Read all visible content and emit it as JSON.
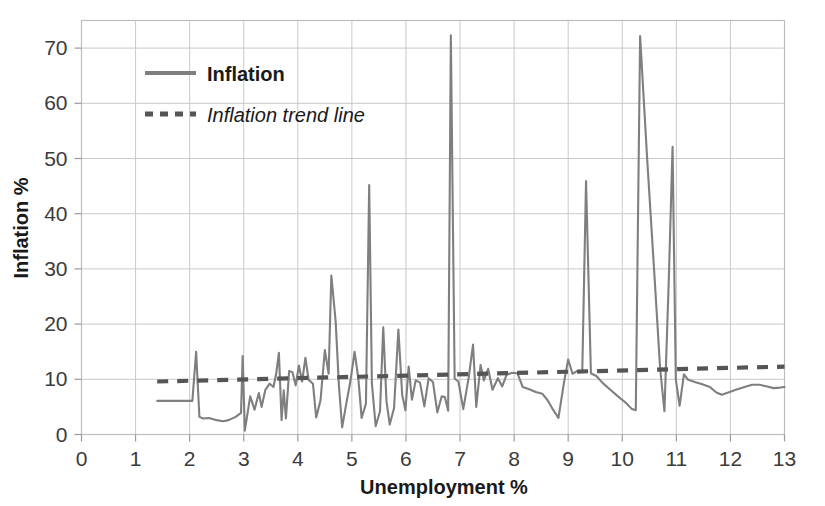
{
  "chart_data": {
    "type": "line",
    "title": "",
    "xlabel": "Unemployment %",
    "ylabel": "Inflation %",
    "xlim": [
      0,
      13
    ],
    "ylim": [
      0,
      75
    ],
    "xticks": [
      "0",
      "1",
      "2",
      "3",
      "4",
      "5",
      "6",
      "7",
      "8",
      "9",
      "10",
      "11",
      "12",
      "13"
    ],
    "yticks": [
      "0",
      "10",
      "20",
      "30",
      "40",
      "50",
      "60",
      "70"
    ],
    "grid": true,
    "legend_position": "upper-left-inside",
    "legend": [
      {
        "label": "Inflation",
        "style": "solid",
        "color": "#7f7f7f",
        "weight": "bold"
      },
      {
        "label": "Inflation trend line",
        "style": "dotted",
        "color": "#555555",
        "weight": "italic"
      }
    ],
    "series": [
      {
        "name": "Inflation",
        "style": "solid",
        "color": "#7f7f7f",
        "points": [
          [
            1.4,
            6.1
          ],
          [
            1.62,
            6.1
          ],
          [
            1.85,
            6.1
          ],
          [
            2.05,
            6.1
          ],
          [
            2.12,
            15.0
          ],
          [
            2.18,
            3.2
          ],
          [
            2.25,
            2.9
          ],
          [
            2.36,
            3.0
          ],
          [
            2.5,
            2.6
          ],
          [
            2.62,
            2.4
          ],
          [
            2.72,
            2.6
          ],
          [
            2.85,
            3.2
          ],
          [
            2.95,
            3.9
          ],
          [
            2.98,
            14.2
          ],
          [
            3.02,
            0.7
          ],
          [
            3.12,
            6.9
          ],
          [
            3.2,
            4.5
          ],
          [
            3.28,
            7.5
          ],
          [
            3.33,
            5.0
          ],
          [
            3.4,
            8.1
          ],
          [
            3.48,
            9.2
          ],
          [
            3.55,
            8.6
          ],
          [
            3.6,
            11.0
          ],
          [
            3.65,
            14.8
          ],
          [
            3.7,
            2.6
          ],
          [
            3.74,
            8.0
          ],
          [
            3.78,
            2.9
          ],
          [
            3.84,
            11.5
          ],
          [
            3.9,
            11.3
          ],
          [
            3.96,
            8.9
          ],
          [
            4.02,
            12.5
          ],
          [
            4.08,
            9.6
          ],
          [
            4.14,
            13.9
          ],
          [
            4.2,
            9.9
          ],
          [
            4.28,
            9.2
          ],
          [
            4.34,
            3.1
          ],
          [
            4.42,
            6.2
          ],
          [
            4.5,
            15.3
          ],
          [
            4.57,
            11.0
          ],
          [
            4.62,
            28.8
          ],
          [
            4.7,
            20.5
          ],
          [
            4.76,
            8.9
          ],
          [
            4.82,
            1.3
          ],
          [
            4.9,
            5.8
          ],
          [
            4.97,
            9.5
          ],
          [
            5.05,
            15.0
          ],
          [
            5.12,
            10.1
          ],
          [
            5.18,
            3.0
          ],
          [
            5.26,
            5.6
          ],
          [
            5.32,
            45.2
          ],
          [
            5.37,
            9.3
          ],
          [
            5.44,
            1.5
          ],
          [
            5.52,
            4.2
          ],
          [
            5.58,
            19.4
          ],
          [
            5.64,
            6.0
          ],
          [
            5.7,
            1.8
          ],
          [
            5.78,
            4.8
          ],
          [
            5.86,
            19.0
          ],
          [
            5.93,
            7.2
          ],
          [
            5.99,
            4.4
          ],
          [
            6.05,
            12.3
          ],
          [
            6.11,
            6.3
          ],
          [
            6.18,
            9.8
          ],
          [
            6.26,
            9.4
          ],
          [
            6.34,
            5.1
          ],
          [
            6.42,
            10.2
          ],
          [
            6.5,
            9.5
          ],
          [
            6.58,
            4.0
          ],
          [
            6.66,
            6.9
          ],
          [
            6.72,
            6.8
          ],
          [
            6.78,
            4.3
          ],
          [
            6.83,
            72.3
          ],
          [
            6.9,
            10.1
          ],
          [
            6.97,
            9.6
          ],
          [
            7.06,
            4.6
          ],
          [
            7.16,
            10.3
          ],
          [
            7.24,
            16.3
          ],
          [
            7.3,
            5.0
          ],
          [
            7.38,
            12.6
          ],
          [
            7.44,
            9.8
          ],
          [
            7.52,
            11.9
          ],
          [
            7.6,
            8.1
          ],
          [
            7.7,
            10.2
          ],
          [
            7.78,
            8.7
          ],
          [
            7.86,
            10.8
          ],
          [
            7.96,
            11.2
          ],
          [
            8.06,
            11.1
          ],
          [
            8.16,
            8.6
          ],
          [
            8.28,
            8.2
          ],
          [
            8.4,
            7.7
          ],
          [
            8.52,
            7.4
          ],
          [
            8.62,
            6.2
          ],
          [
            8.72,
            4.5
          ],
          [
            8.82,
            3.0
          ],
          [
            8.92,
            9.3
          ],
          [
            9.0,
            13.6
          ],
          [
            9.08,
            11.0
          ],
          [
            9.16,
            11.5
          ],
          [
            9.26,
            11.3
          ],
          [
            9.33,
            45.9
          ],
          [
            9.42,
            11.1
          ],
          [
            9.52,
            10.6
          ],
          [
            9.64,
            9.3
          ],
          [
            9.78,
            8.1
          ],
          [
            9.92,
            6.9
          ],
          [
            10.06,
            5.8
          ],
          [
            10.18,
            4.6
          ],
          [
            10.25,
            4.4
          ],
          [
            10.33,
            72.2
          ],
          [
            10.46,
            50.0
          ],
          [
            10.6,
            28.0
          ],
          [
            10.7,
            12.0
          ],
          [
            10.78,
            4.2
          ],
          [
            10.86,
            28.0
          ],
          [
            10.93,
            52.1
          ],
          [
            10.99,
            10.0
          ],
          [
            11.06,
            5.2
          ],
          [
            11.14,
            10.9
          ],
          [
            11.22,
            9.9
          ],
          [
            11.34,
            9.5
          ],
          [
            11.48,
            9.1
          ],
          [
            11.62,
            8.6
          ],
          [
            11.74,
            7.6
          ],
          [
            11.84,
            7.2
          ],
          [
            11.96,
            7.6
          ],
          [
            12.1,
            8.1
          ],
          [
            12.26,
            8.6
          ],
          [
            12.4,
            9.0
          ],
          [
            12.54,
            9.0
          ],
          [
            12.68,
            8.7
          ],
          [
            12.8,
            8.4
          ],
          [
            12.92,
            8.5
          ],
          [
            13.0,
            8.6
          ]
        ]
      },
      {
        "name": "Inflation trend line",
        "style": "dotted",
        "color": "#555555",
        "points": [
          [
            1.4,
            9.6
          ],
          [
            13.0,
            12.3
          ]
        ]
      }
    ]
  }
}
